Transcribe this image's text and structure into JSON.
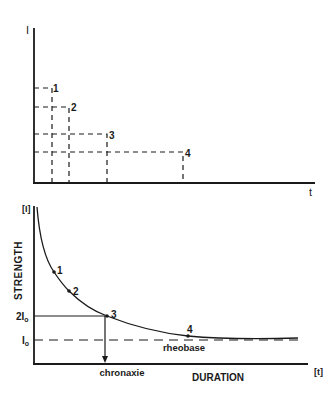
{
  "top_diagram": {
    "y_axis_label": "I",
    "x_axis_label": "t",
    "pulses": [
      {
        "label": "1",
        "x": 52,
        "y": 88
      },
      {
        "label": "2",
        "x": 69,
        "y": 107
      },
      {
        "label": "3",
        "x": 107,
        "y": 134
      },
      {
        "label": "4",
        "x": 183,
        "y": 152
      }
    ]
  },
  "bottom_diagram": {
    "y_axis_label": "[I]",
    "y_axis_title": "STRENGTH",
    "x_axis_label": "[t]",
    "x_axis_title": "DURATION",
    "level_2i0": "2I",
    "level_i0": "I",
    "subscript": "o",
    "rheobase_label": "rheobase",
    "chronaxie_label": "chronaxie",
    "points": [
      {
        "label": "1",
        "x": 54,
        "y": 272
      },
      {
        "label": "2",
        "x": 69,
        "y": 291
      },
      {
        "label": "3",
        "x": 107,
        "y": 316
      },
      {
        "label": "4",
        "x": 188,
        "y": 336
      }
    ]
  }
}
